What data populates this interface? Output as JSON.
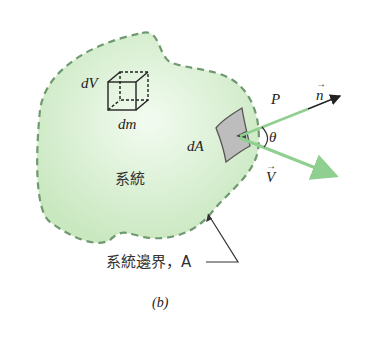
{
  "figure": {
    "panel_label": "(b)",
    "colors": {
      "region_fill": "#d6efcf",
      "boundary": "#6f9a6f",
      "arrow_green": "#8fcf8f",
      "arrow_black": "#222222",
      "patch_fill": "#bdbdbd"
    },
    "labels": {
      "volume_element": "dV",
      "mass_element": "dm",
      "area_element": "dA",
      "system": "系統",
      "point": "P",
      "normal_vector": "n",
      "velocity_vector": "V",
      "angle": "θ",
      "boundary_caption": "系統邊界，A",
      "arrow_glyph": "→"
    }
  }
}
